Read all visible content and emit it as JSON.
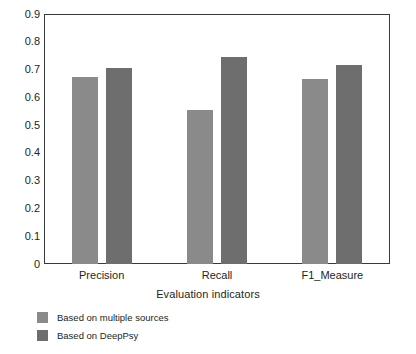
{
  "chart_data": {
    "type": "bar",
    "title": "",
    "xlabel": "Evaluation indicators",
    "ylabel": "Accuracy",
    "categories": [
      "Precision",
      "Recall",
      "F1_Measure"
    ],
    "series": [
      {
        "name": "Based on multiple sources",
        "color": "#8a8a8a",
        "values": [
          0.675,
          0.555,
          0.665
        ]
      },
      {
        "name": "Based on DeepPsy",
        "color": "#6e6e6e",
        "values": [
          0.705,
          0.745,
          0.715
        ]
      }
    ],
    "ylim": [
      0,
      0.9
    ],
    "ytick_labels": [
      "0.9",
      "0.8",
      "0.7",
      "0.6",
      "0.5",
      "0.4",
      "0.3",
      "0.2",
      "0.1",
      "0"
    ],
    "ytick_values": [
      0.9,
      0.8,
      0.7,
      0.6,
      0.5,
      0.4,
      0.3,
      0.2,
      0.1,
      0
    ],
    "grid": false,
    "legend_position": "bottom-left",
    "plot_border": true
  }
}
